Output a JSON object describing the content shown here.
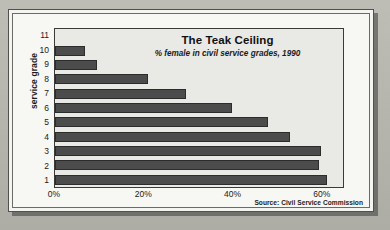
{
  "figure": {
    "title": "The Teak Ceiling",
    "subtitle": "% female in civil service grades, 1990",
    "source_note": "Source: Civil Service Commission",
    "y_axis_title": "service grade"
  },
  "colors": {
    "page_background": "#b6b6ae",
    "card_background": "#f7f7f4",
    "plot_background": "#e9e9e6",
    "bar_fill": "#4c4c4c",
    "bar_border": "#2c2c2c",
    "frame": "#3a3a38",
    "text": "#1b1b1b"
  },
  "chart_data": {
    "type": "bar",
    "orientation": "horizontal",
    "title": "The Teak Ceiling",
    "subtitle": "% female in civil service grades, 1990",
    "xlabel": "",
    "ylabel": "service grade",
    "xlim": [
      0,
      65
    ],
    "ylim": null,
    "grid": false,
    "legend": null,
    "x_tick_labels": [
      "0%",
      "20%",
      "40%",
      "60%"
    ],
    "x_tick_values": [
      0,
      20,
      40,
      60
    ],
    "categories": [
      "11",
      "10",
      "9",
      "8",
      "7",
      "6",
      "5",
      "4",
      "3",
      "2",
      "1"
    ],
    "values": [
      0,
      6.7,
      9.5,
      21,
      29.5,
      40,
      48,
      53,
      60,
      59.5,
      61.5
    ],
    "value_unit": "%",
    "source": "Source: Civil Service Commission"
  }
}
